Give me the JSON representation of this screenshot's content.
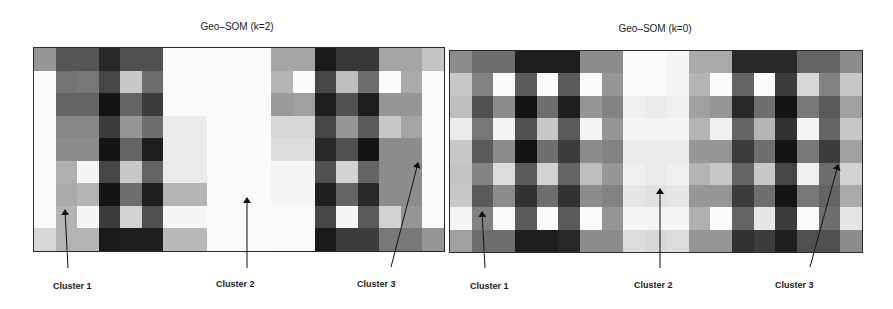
{
  "chart_data": [
    {
      "type": "heatmap",
      "title": "Geo–SOM (k=2)",
      "rows": 9,
      "cols": 19,
      "colormap": "grayscale (0=black, 255=white)",
      "grid_on": true,
      "annotations": [
        {
          "text": "Cluster 1",
          "arrow_tip": [
            65,
            210
          ],
          "arrow_tail": [
            68,
            268
          ]
        },
        {
          "text": "Cluster 2",
          "arrow_tip": [
            247,
            198
          ],
          "arrow_tail": [
            247,
            268
          ]
        },
        {
          "text": "Cluster 3",
          "arrow_tip": [
            418,
            163
          ],
          "arrow_tail": [
            391,
            267
          ]
        }
      ],
      "values": [
        [
          150,
          85,
          85,
          40,
          80,
          80,
          250,
          250,
          250,
          250,
          250,
          165,
          165,
          25,
          55,
          55,
          165,
          165,
          195
        ],
        [
          250,
          115,
          120,
          70,
          200,
          110,
          250,
          250,
          250,
          250,
          250,
          180,
          250,
          70,
          190,
          110,
          250,
          170,
          250
        ],
        [
          250,
          100,
          100,
          20,
          100,
          60,
          250,
          250,
          250,
          250,
          250,
          155,
          160,
          30,
          80,
          30,
          150,
          150,
          250
        ],
        [
          250,
          135,
          135,
          60,
          150,
          110,
          235,
          235,
          250,
          250,
          250,
          215,
          215,
          70,
          150,
          90,
          200,
          165,
          250
        ],
        [
          250,
          140,
          140,
          20,
          100,
          30,
          235,
          235,
          250,
          250,
          250,
          220,
          220,
          40,
          80,
          20,
          140,
          140,
          250
        ],
        [
          250,
          175,
          245,
          70,
          200,
          100,
          235,
          235,
          250,
          250,
          250,
          245,
          245,
          80,
          210,
          100,
          140,
          140,
          250
        ],
        [
          250,
          170,
          180,
          20,
          110,
          30,
          180,
          180,
          250,
          250,
          250,
          245,
          245,
          30,
          100,
          40,
          140,
          140,
          250
        ],
        [
          250,
          180,
          245,
          60,
          210,
          80,
          245,
          245,
          250,
          250,
          250,
          248,
          248,
          70,
          245,
          90,
          210,
          150,
          250
        ],
        [
          215,
          180,
          180,
          25,
          30,
          30,
          185,
          185,
          250,
          250,
          250,
          248,
          248,
          25,
          60,
          60,
          120,
          120,
          150
        ]
      ]
    },
    {
      "type": "heatmap",
      "title": "Geo–SOM (k=0)",
      "rows": 9,
      "cols": 19,
      "colormap": "grayscale (0=black, 255=white)",
      "grid_on": true,
      "annotations": [
        {
          "text": "Cluster 1",
          "arrow_tip": [
            482,
            212
          ],
          "arrow_tail": [
            485,
            268
          ]
        },
        {
          "text": "Cluster 2",
          "arrow_tip": [
            660,
            189
          ],
          "arrow_tail": [
            660,
            268
          ]
        },
        {
          "text": "Cluster 3",
          "arrow_tip": [
            838,
            165
          ],
          "arrow_tail": [
            810,
            267
          ]
        }
      ],
      "values": [
        [
          140,
          110,
          110,
          30,
          30,
          30,
          140,
          140,
          250,
          250,
          245,
          170,
          170,
          40,
          40,
          40,
          100,
          100,
          140
        ],
        [
          200,
          130,
          250,
          90,
          250,
          90,
          250,
          150,
          250,
          250,
          245,
          180,
          250,
          100,
          250,
          60,
          215,
          130,
          200
        ],
        [
          190,
          80,
          140,
          20,
          110,
          30,
          150,
          130,
          240,
          235,
          240,
          160,
          150,
          40,
          110,
          20,
          120,
          90,
          160
        ],
        [
          235,
          120,
          245,
          80,
          200,
          90,
          245,
          150,
          245,
          245,
          245,
          180,
          240,
          100,
          180,
          50,
          245,
          100,
          200
        ],
        [
          200,
          90,
          140,
          20,
          110,
          60,
          140,
          130,
          235,
          235,
          235,
          150,
          150,
          60,
          110,
          20,
          120,
          60,
          160
        ],
        [
          195,
          130,
          220,
          90,
          210,
          100,
          190,
          150,
          240,
          235,
          240,
          180,
          200,
          100,
          200,
          70,
          240,
          110,
          210
        ],
        [
          200,
          90,
          140,
          50,
          110,
          50,
          140,
          130,
          230,
          225,
          230,
          150,
          150,
          60,
          110,
          20,
          120,
          100,
          170
        ],
        [
          245,
          130,
          250,
          90,
          250,
          90,
          250,
          150,
          245,
          245,
          245,
          175,
          250,
          100,
          230,
          60,
          250,
          110,
          230
        ],
        [
          160,
          110,
          110,
          30,
          30,
          40,
          140,
          140,
          220,
          215,
          220,
          150,
          150,
          50,
          60,
          30,
          80,
          80,
          140
        ]
      ]
    }
  ],
  "panels": [
    {
      "title": "Geo–SOM (k=2)",
      "labels": {
        "cluster1": "Cluster 1",
        "cluster2": "Cluster 2",
        "cluster3": "Cluster 3"
      }
    },
    {
      "title": "Geo–SOM (k=0)",
      "labels": {
        "cluster1": "Cluster 1",
        "cluster2": "Cluster 2",
        "cluster3": "Cluster 3"
      }
    }
  ]
}
